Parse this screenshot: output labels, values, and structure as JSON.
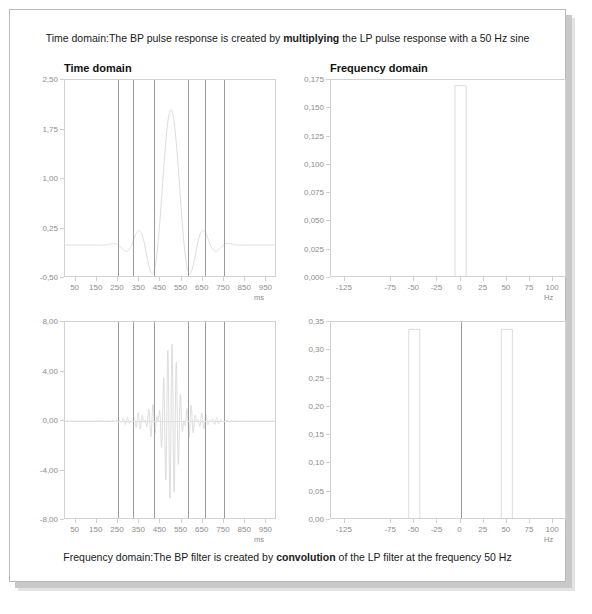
{
  "figure": {
    "caption_top_parts": [
      "Time domain:The BP pulse response is created by ",
      "multiplying",
      " the LP pulse response with a 50 Hz sine"
    ],
    "caption_bottom_parts": [
      "Frequency domain:The BP filter is created by ",
      "convolution",
      " of the LP filter at the frequency 50 Hz"
    ],
    "caption_top_pre": "Time domain:The BP pulse response is created by ",
    "caption_top_bold": "multiplying",
    "caption_top_post": " the LP pulse response with a 50 Hz sine",
    "caption_bottom_pre": "Frequency domain:The BP filter is created by ",
    "caption_bottom_bold": "convolution",
    "caption_bottom_post": " of the LP filter at the frequency 50 Hz",
    "title_time": "Time domain",
    "title_frequency": "Frequency domain",
    "colors": {
      "curve": "#d8d8d8",
      "marker_line": "#9a9a9a",
      "axis": "#d2d2d2",
      "tick_text": "#8d8d8d",
      "caption_text": "#1a1a1a",
      "shadow": "#c9c9c9"
    }
  },
  "chart_data": [
    {
      "id": "lp-pulse-time",
      "type": "line",
      "title": "Time domain",
      "xlabel": "ms",
      "ylabel": "",
      "xlim": [
        0,
        1000
      ],
      "ylim": [
        -0.5,
        2.5
      ],
      "xticks": [
        50,
        150,
        250,
        350,
        450,
        550,
        650,
        750,
        850,
        950
      ],
      "xticklabels": [
        "50",
        "150",
        "250",
        "350",
        "450",
        "550",
        "650",
        "750",
        "850",
        "950"
      ],
      "yticks": [
        -0.5,
        0.25,
        1.0,
        1.75,
        2.5
      ],
      "yticklabels": [
        "-0,50",
        "0,25",
        "1,00",
        "1,75",
        "2,50"
      ],
      "grid": false,
      "description": "LP filter pulse response, sinc-like, main lobe peaking near 500 ms",
      "peak_value": 2.05,
      "peak_x": 500,
      "baseline_value": 0.0,
      "vertical_markers": [
        250,
        320,
        420,
        580,
        660,
        750
      ],
      "series": [
        {
          "name": "LP pulse response",
          "x": [
            0,
            20,
            40,
            60,
            80,
            100,
            120,
            140,
            160,
            180,
            200,
            220,
            240,
            260,
            280,
            300,
            320,
            340,
            360,
            380,
            400,
            420,
            440,
            460,
            480,
            500,
            520,
            540,
            560,
            580,
            600,
            620,
            640,
            660,
            680,
            700,
            720,
            740,
            760,
            780,
            800,
            820,
            840,
            860,
            880,
            900,
            920,
            940,
            960,
            980,
            1000
          ],
          "y": [
            0.0,
            0.0,
            0.0,
            0.0,
            0.01,
            0.02,
            0.0,
            -0.03,
            -0.04,
            -0.02,
            0.02,
            0.06,
            0.09,
            0.09,
            0.05,
            -0.04,
            -0.14,
            -0.21,
            -0.22,
            -0.14,
            0.06,
            0.39,
            0.85,
            1.38,
            1.83,
            2.05,
            1.92,
            1.48,
            0.93,
            0.42,
            0.06,
            -0.14,
            -0.21,
            -0.19,
            -0.1,
            0.01,
            0.08,
            0.1,
            0.07,
            0.02,
            -0.02,
            -0.04,
            -0.03,
            -0.01,
            0.01,
            0.02,
            0.01,
            0.0,
            0.0,
            0.0,
            0.0
          ]
        }
      ]
    },
    {
      "id": "lp-filter-frequency",
      "type": "line",
      "title": "Frequency domain",
      "xlabel": "Hz",
      "ylabel": "",
      "xlim": [
        -140,
        115
      ],
      "ylim": [
        0.0,
        0.175
      ],
      "xticks": [
        -125,
        -75,
        -50,
        -25,
        0,
        25,
        50,
        75,
        100
      ],
      "xticklabels": [
        "-125",
        "-75",
        "-50",
        "-25",
        "0",
        "25",
        "50",
        "75",
        "100"
      ],
      "yticks": [
        0.0,
        0.025,
        0.05,
        0.075,
        0.1,
        0.125,
        0.15,
        0.175
      ],
      "yticklabels": [
        "0,000",
        "0,025",
        "0,050",
        "0,075",
        "0,100",
        "0,125",
        "0,150",
        "0,175"
      ],
      "grid": false,
      "description": "LP filter magnitude response: single narrow rectangular passband centered at 0 Hz",
      "passbands": [
        {
          "center": 0,
          "half_width": 6,
          "height": 0.17
        }
      ],
      "series": [
        {
          "name": "LP filter",
          "x": [
            -140,
            -60,
            -20,
            -8,
            -7,
            -6,
            6,
            7,
            8,
            20,
            60,
            115
          ],
          "y": [
            0.0,
            0.0,
            0.0,
            0.0,
            0.002,
            0.17,
            0.17,
            0.002,
            0.0,
            0.0,
            0.0,
            0.0
          ]
        }
      ]
    },
    {
      "id": "bp-pulse-time",
      "type": "line",
      "title": "",
      "xlabel": "ms",
      "ylabel": "",
      "xlim": [
        0,
        1000
      ],
      "ylim": [
        -8.0,
        8.0
      ],
      "xticks": [
        50,
        150,
        250,
        350,
        450,
        550,
        650,
        750,
        850,
        950
      ],
      "xticklabels": [
        "50",
        "150",
        "250",
        "350",
        "450",
        "550",
        "650",
        "750",
        "850",
        "950"
      ],
      "yticks": [
        -8.0,
        -4.0,
        0.0,
        4.0,
        8.0
      ],
      "yticklabels": [
        "-8,00",
        "-4,00",
        "0,00",
        "4,00",
        "8,00"
      ],
      "grid": false,
      "description": "BP pulse response: LP sinc envelope multiplied by a 50 Hz sine carrier, oscillating about zero, max envelope ~6.3 near 500 ms",
      "envelope_peak": 6.3,
      "carrier_hz": 50,
      "baseline_value": 0.0,
      "vertical_markers": [
        250,
        320,
        420,
        580,
        660,
        750
      ]
    },
    {
      "id": "bp-filter-frequency",
      "type": "line",
      "title": "",
      "xlabel": "Hz",
      "ylabel": "",
      "xlim": [
        -140,
        115
      ],
      "ylim": [
        0.0,
        0.35
      ],
      "xticks": [
        -125,
        -75,
        -50,
        -25,
        0,
        25,
        50,
        75,
        100
      ],
      "xticklabels": [
        "-125",
        "-75",
        "-50",
        "-25",
        "0",
        "25",
        "50",
        "75",
        "100"
      ],
      "yticks": [
        0.0,
        0.05,
        0.1,
        0.15,
        0.2,
        0.25,
        0.3,
        0.35
      ],
      "yticklabels": [
        "0,00",
        "0,05",
        "0,10",
        "0,15",
        "0,20",
        "0,25",
        "0,30",
        "0,35"
      ],
      "grid": false,
      "description": "BP filter magnitude response: two narrow rectangular passbands centered at -50 Hz and +50 Hz",
      "passbands": [
        {
          "center": -50,
          "half_width": 6,
          "height": 0.337
        },
        {
          "center": 50,
          "half_width": 6,
          "height": 0.337
        }
      ],
      "center_marker_hz": 0
    }
  ]
}
